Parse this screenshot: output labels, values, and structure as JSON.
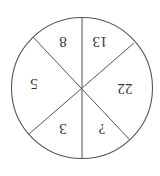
{
  "diagram": {
    "type": "sector-circle",
    "orientation": "rotated-180",
    "stroke_color": "#555555",
    "background": "#ffffff",
    "sectors": [
      {
        "label": "8"
      },
      {
        "label": "13"
      },
      {
        "label": "22"
      },
      {
        "label": "?"
      },
      {
        "label": "3"
      },
      {
        "label": "5"
      }
    ]
  }
}
